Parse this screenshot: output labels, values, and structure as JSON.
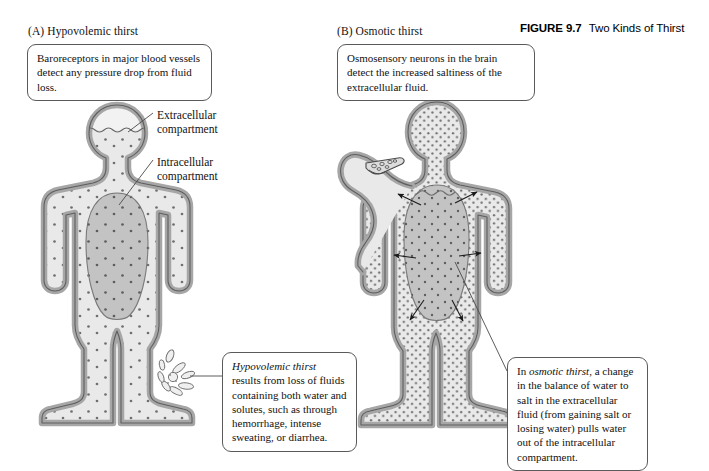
{
  "figure": {
    "number_label": "FIGURE 9.7",
    "title": "Two Kinds of Thirst"
  },
  "panels": [
    {
      "id": "A",
      "label": "(A)  Hypovolemic thirst",
      "top_callout": "Baroreceptors in major blood vessels detect any pressure drop from fluid loss.",
      "bottom_callout_italic": "Hypovolemic thirst",
      "bottom_callout_rest": " results from loss of fluids containing both water and solutes, such as through hemorrhage, intense sweating, or diarrhea.",
      "annotations": [
        {
          "name": "extracellular",
          "line1": "Extracellular",
          "line2": "compartment"
        },
        {
          "name": "intracellular",
          "line1": "Intracellular",
          "line2": "compartment"
        }
      ]
    },
    {
      "id": "B",
      "label": "(B)  Osmotic thirst",
      "top_callout": "Osmosensory neurons in the brain detect the increased saltiness of the extracellular fluid.",
      "bottom_callout_pre": "In ",
      "bottom_callout_italic": "osmotic thirst",
      "bottom_callout_rest": ", a change in the balance of water to salt in the extracellular fluid (from gaining salt or losing water) pulls water out of the intracellular compartment."
    }
  ],
  "colors": {
    "extracellular_fill": "#e9e9e9",
    "intracellular_fill": "#c3c3c3",
    "body_outline": "#9b9b9b",
    "stroke_dark": "#4a4a4a",
    "dot_color": "#707070",
    "callout_border": "#5a5a5a",
    "background": "#ffffff"
  },
  "diagram": {
    "panel_a": {
      "head_fluid_level_wavy": true,
      "head_partially_empty": true,
      "leak_location": "right foot / lower leg",
      "leak_description": "fluid spray escaping from the leg",
      "dot_density": "sparse"
    },
    "panel_b": {
      "head_full_of_dots": true,
      "raised_arm_holding_salty_food": true,
      "intracellular_shrinking_wavy_top": true,
      "outward_arrows_count": 5,
      "arrow_direction": "outward from intracellular compartment",
      "dot_density": "dense"
    }
  }
}
